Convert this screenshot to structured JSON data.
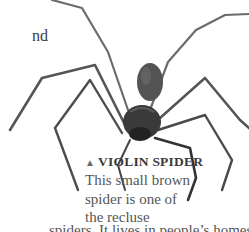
{
  "page": {
    "fragment_text": "nd",
    "caption": {
      "marker": "▲",
      "title": "VIOLIN SPIDER",
      "lines": [
        "This small brown",
        "spider is one of",
        "the recluse"
      ],
      "last_line": "spiders. It lives in people’s homes"
    }
  },
  "image": {
    "subject": "violin spider",
    "colors": {
      "body": "#3d3d3d",
      "legs": "#4a4a4a",
      "background": "#ffffff",
      "text": "#4a4a4a"
    }
  }
}
